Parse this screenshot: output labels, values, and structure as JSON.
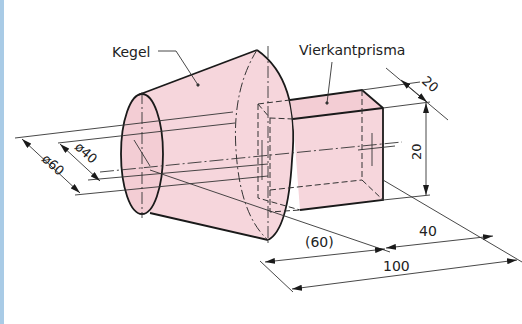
{
  "figure": {
    "labels": {
      "cone": "Kegel",
      "prism": "Vierkantprisma"
    },
    "dimensions": {
      "outer_diameter": "ø60",
      "inner_diameter": "ø40",
      "prism_depth": "20",
      "prism_height": "20",
      "cone_length": "(60)",
      "prism_length": "40",
      "total_length": "100"
    },
    "colors": {
      "fill": "#f6d6dc",
      "stroke": "#1a1a1a",
      "thin": "#333333",
      "border": "#a9cbe6"
    }
  }
}
